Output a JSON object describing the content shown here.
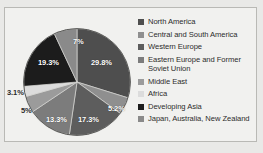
{
  "figure": {
    "title_remnant": "· · · ·",
    "background_color": "#e9e9e7",
    "border_color": "#b9b9b5"
  },
  "chart_data": {
    "type": "pie",
    "title": "",
    "legend_position": "right",
    "grid": false,
    "categories": [
      "North America",
      "Central and South America",
      "Western Europe",
      "Eastern Europe and Former Soviet Union",
      "Middle East",
      "Africa",
      "Developing Asia",
      "Japan, Australia, New Zealand"
    ],
    "values": [
      29.8,
      5.2,
      17.3,
      13.3,
      5,
      3.1,
      19.3,
      7
    ],
    "value_labels": [
      "29.8%",
      "5.2%",
      "17.3%",
      "13.3%",
      "5%",
      "3.1%",
      "19.3%",
      "7%"
    ],
    "colors": [
      "#4e4e4e",
      "#8f8f8f",
      "#5d5d5d",
      "#7c7c7c",
      "#9b9b9b",
      "#dcdcdc",
      "#1c1c1c",
      "#8a8a8a"
    ],
    "unit": "percent"
  },
  "legend": {
    "items": [
      {
        "label": "North America",
        "color": "#4e4e4e",
        "swatch": "legend-swatch-north-america"
      },
      {
        "label": "Central and South America",
        "color": "#8f8f8f",
        "swatch": "legend-swatch-central-south-america"
      },
      {
        "label": "Western Europe",
        "color": "#5d5d5d",
        "swatch": "legend-swatch-western-europe"
      },
      {
        "label": "Eastern Europe and Former",
        "label2": "Soviet Union",
        "color": "#7c7c7c",
        "swatch": "legend-swatch-eastern-europe"
      },
      {
        "label": "Middle East",
        "color": "#9b9b9b",
        "swatch": "legend-swatch-middle-east"
      },
      {
        "label": "Africa",
        "color": "#dcdcdc",
        "swatch": "legend-swatch-africa"
      },
      {
        "label": "Developing Asia",
        "color": "#1c1c1c",
        "swatch": "legend-swatch-developing-asia"
      },
      {
        "label": "Japan, Australia, New Zealand",
        "color": "#8a8a8a",
        "swatch": "legend-swatch-japan-australia-nz"
      }
    ]
  },
  "pie_labels": {
    "north_america": "29.8%",
    "central_south_america": "5.2%",
    "western_europe": "17.3%",
    "eastern_europe": "13.3%",
    "middle_east": "5%",
    "africa": "3.1%",
    "developing_asia": "19.3%",
    "japan_australia_nz": "7%"
  }
}
